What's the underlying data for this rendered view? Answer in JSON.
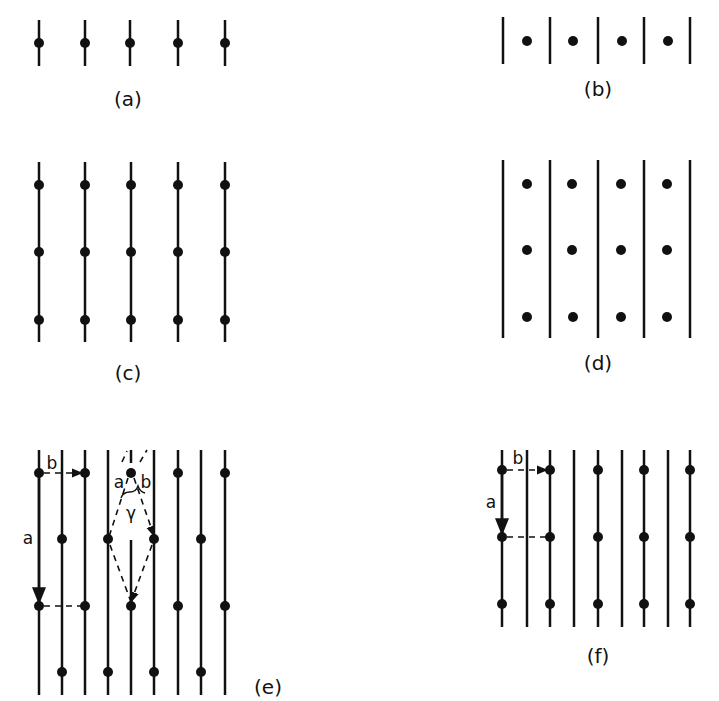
{
  "figure": {
    "panels": [
      {
        "id": "a",
        "label": "(a)",
        "description": "Single row: 5 lines each with a dot on it"
      },
      {
        "id": "b",
        "label": "(b)",
        "description": "Single row: 5 lines with dots between them"
      },
      {
        "id": "c",
        "label": "(c)",
        "description": "5 lines with 3 dots on each line"
      },
      {
        "id": "d",
        "label": "(d)",
        "description": "5 lines with 3 dots in each gap between lines"
      },
      {
        "id": "e",
        "label": "(e)",
        "description": "9 lines, dots on alternating lines staggered; lattice vectors a, b and angle gamma"
      },
      {
        "id": "f",
        "label": "(f)",
        "description": "9 lines, dots on alternate lines aligned; lattice vectors a and b"
      }
    ],
    "annotations": {
      "e": {
        "vec_a": "a",
        "vec_b": "b",
        "inner_a": "a",
        "inner_b": "b",
        "angle": "γ"
      },
      "f": {
        "vec_a": "a",
        "vec_b": "b"
      }
    },
    "colors": {
      "ink": "#111111",
      "background": "#ffffff"
    }
  }
}
